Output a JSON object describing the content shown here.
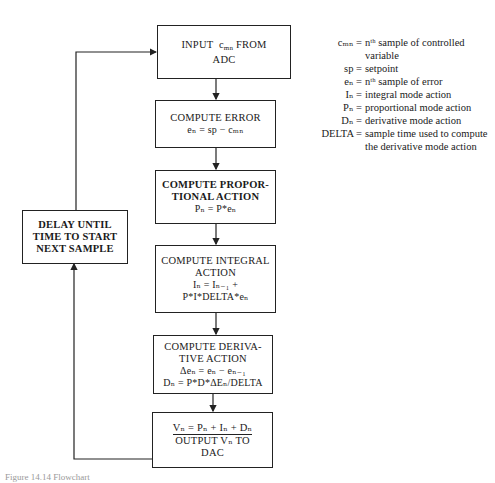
{
  "flowchart": {
    "input_box": {
      "line1_pre": "INPUT",
      "var": "c",
      "var_sub": "mn",
      "line1_post": "FROM",
      "line2": "ADC"
    },
    "error_box": {
      "title": "COMPUTE ERROR",
      "eq": "eₙ = sp − cₘₙ"
    },
    "proportional_box": {
      "line1": "COMPUTE PROPOR-",
      "line2": "TIONAL ACTION",
      "eq": "Pₙ = P*eₙ"
    },
    "integral_box": {
      "line1": "COMPUTE INTEGRAL",
      "line2": "ACTION",
      "eq1": "Iₙ = Iₙ₋₁ +",
      "eq2": "P*I*DELTA*eₙ"
    },
    "derivative_box": {
      "line1": "COMPUTE DERIVA-",
      "line2": "TIVE ACTION",
      "eq1": "Δeₙ = eₙ − eₙ₋₁",
      "eq2": "Dₙ = P*D*ΔEₙ/DELTA"
    },
    "output_box": {
      "line1": "Vₙ = Pₙ + Iₙ + Dₙ",
      "line2": "OUTPUT Vₙ TO",
      "line3": "DAC"
    },
    "delay_box": {
      "line1": "DELAY UNTIL",
      "line2": "TIME TO START",
      "line3": "NEXT SAMPLE"
    }
  },
  "legend": [
    {
      "key": "cₘₙ =",
      "value": "nᵗʰ sample of controlled variable"
    },
    {
      "key": "sp =",
      "value": "setpoint"
    },
    {
      "key": "eₙ =",
      "value": "nᵗʰ sample of error"
    },
    {
      "key": "Iₙ =",
      "value": "integral mode action"
    },
    {
      "key": "Pₙ =",
      "value": "proportional mode action"
    },
    {
      "key": "Dₙ =",
      "value": "derivative mode action"
    },
    {
      "key": "DELTA =",
      "value": "sample time used to compute the derivative mode action"
    }
  ],
  "caption": "Figure 14.14   Flowchart"
}
